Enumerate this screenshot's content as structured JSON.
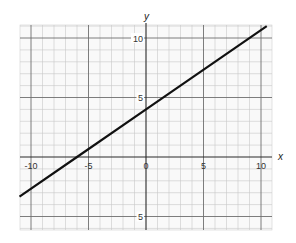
{
  "chart_data": {
    "type": "line",
    "title": "",
    "xlabel": "x",
    "ylabel": "y",
    "xlim": [
      -10.5,
      10.5
    ],
    "ylim": [
      -6,
      11
    ],
    "grid": true,
    "grid_minor_step": 1,
    "grid_major_step": 5,
    "x_ticks": [
      {
        "value": -10,
        "label": "-10"
      },
      {
        "value": -5,
        "label": "-5"
      },
      {
        "value": 0,
        "label": "0"
      },
      {
        "value": 5,
        "label": "5"
      },
      {
        "value": 10,
        "label": "10"
      }
    ],
    "y_ticks": [
      {
        "value": 10,
        "label": "10"
      },
      {
        "value": 5,
        "label": "5"
      },
      {
        "value": -5,
        "label": "5"
      }
    ],
    "series": [
      {
        "name": "y = (2/3)x + 4",
        "slope": 0.6667,
        "intercept": 4,
        "points": [
          [
            -11,
            -3.33
          ],
          [
            -6,
            0
          ],
          [
            0,
            4
          ],
          [
            10.5,
            11
          ]
        ],
        "color": "#111111"
      }
    ],
    "legend": null
  },
  "layout": {
    "origin_px": [
      146,
      157
    ],
    "x_unit_px": 11.5,
    "y_unit_px": 11.9,
    "plot_left_px": 20,
    "plot_right_px": 272,
    "plot_top_px": 25,
    "plot_bottom_px": 230
  }
}
